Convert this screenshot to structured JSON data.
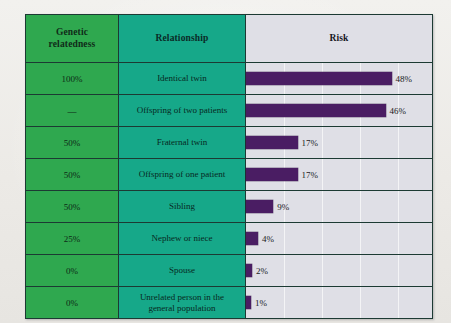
{
  "table": {
    "columns": [
      {
        "key": "relatedness",
        "label": "Genetic\nrelatedness",
        "label_line1": "Genetic",
        "label_line2": "relatedness"
      },
      {
        "key": "relationship",
        "label": "Relationship"
      },
      {
        "key": "risk",
        "label": "Risk"
      }
    ],
    "rows": [
      {
        "relatedness": "100%",
        "relationship": "Identical twin",
        "risk_label": "48%",
        "risk_value": 48
      },
      {
        "relatedness": "—",
        "relationship": "Offspring of two patients",
        "risk_label": "46%",
        "risk_value": 46
      },
      {
        "relatedness": "50%",
        "relationship": "Fraternal twin",
        "risk_label": "17%",
        "risk_value": 17
      },
      {
        "relatedness": "50%",
        "relationship": "Offspring of one patient",
        "risk_label": "17%",
        "risk_value": 17
      },
      {
        "relatedness": "50%",
        "relationship": "Sibling",
        "risk_label": "9%",
        "risk_value": 9
      },
      {
        "relatedness": "25%",
        "relationship": "Nephew or niece",
        "risk_label": "4%",
        "risk_value": 4
      },
      {
        "relatedness": "0%",
        "relationship": "Spouse",
        "risk_label": "2%",
        "risk_value": 2
      },
      {
        "relatedness": "0%",
        "relationship": "Unrelated person in the general population",
        "relationship_line1": "Unrelated person in the",
        "relationship_line2": "general population",
        "risk_label": "1%",
        "risk_value": 1
      }
    ]
  },
  "chart_data": {
    "type": "bar",
    "title": "Risk",
    "orientation": "horizontal",
    "categories": [
      "Identical twin",
      "Offspring of two patients",
      "Fraternal twin",
      "Offspring of one patient",
      "Sibling",
      "Nephew or niece",
      "Spouse",
      "Unrelated person in the general population"
    ],
    "values": [
      48,
      46,
      17,
      17,
      9,
      4,
      2,
      1
    ],
    "data_labels": [
      "48%",
      "46%",
      "17%",
      "17%",
      "9%",
      "4%",
      "2%",
      "1%"
    ],
    "genetic_relatedness": [
      "100%",
      "—",
      "50%",
      "50%",
      "50%",
      "25%",
      "0%",
      "0%"
    ],
    "xlabel": "",
    "ylabel": "",
    "xlim": [
      0,
      61
    ],
    "grid": true,
    "gridline_step": 12.5,
    "legend": "none",
    "bar_color": "#4a1d63",
    "plot_background": "#dfdfe6"
  },
  "colors": {
    "relatedness_column": "#2fa84f",
    "relationship_column": "#16a889",
    "risk_column": "#dfdfe6",
    "bar": "#4a1d63",
    "border": "#1c3a33",
    "page_background": "#eeedea"
  }
}
